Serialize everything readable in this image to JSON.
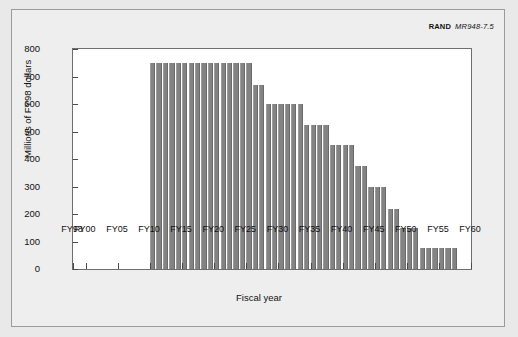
{
  "credit": {
    "org": "RAND",
    "number": "MR948-7.5"
  },
  "chart_data": {
    "type": "bar",
    "title": "",
    "xlabel": "Fiscal year",
    "ylabel": "Millions of FY98 dollars",
    "ylim": [
      0,
      800
    ],
    "ytick_values": [
      0,
      100,
      200,
      300,
      400,
      500,
      600,
      700,
      800
    ],
    "ytick_labels": [
      "0",
      "100",
      "200",
      "300",
      "400",
      "500",
      "600",
      "700",
      "800"
    ],
    "xlim": [
      1998,
      1960
    ],
    "xtick_labels": [
      "FY98",
      "FY00",
      "FY05",
      "FY10",
      "FY15",
      "FY20",
      "FY25",
      "FY30",
      "FY35",
      "FY40",
      "FY45",
      "FY50",
      "FY55",
      "FY60"
    ],
    "xtick_positions": [
      1998,
      2000,
      2005,
      2010,
      2015,
      2020,
      2025,
      2030,
      2035,
      2040,
      2045,
      2050,
      2055,
      2060
    ],
    "grid": false,
    "legend": "none",
    "bar_color": "#838383",
    "categories": [
      "FY10",
      "FY11",
      "FY12",
      "FY13",
      "FY14",
      "FY15",
      "FY16",
      "FY17",
      "FY18",
      "FY19",
      "FY20",
      "FY21",
      "FY22",
      "FY23",
      "FY24",
      "FY25",
      "FY26",
      "FY27",
      "FY28",
      "FY29",
      "FY30",
      "FY31",
      "FY32",
      "FY33",
      "FY34",
      "FY35",
      "FY36",
      "FY37",
      "FY38",
      "FY39",
      "FY40",
      "FY41",
      "FY42",
      "FY43",
      "FY44",
      "FY45",
      "FY46",
      "FY47",
      "FY48",
      "FY49",
      "FY50",
      "FY51",
      "FY52",
      "FY53",
      "FY54",
      "FY55",
      "FY56",
      "FY57"
    ],
    "values": [
      750,
      750,
      750,
      750,
      750,
      750,
      750,
      750,
      750,
      750,
      750,
      750,
      750,
      750,
      750,
      750,
      670,
      670,
      600,
      600,
      600,
      600,
      600,
      600,
      525,
      525,
      525,
      525,
      450,
      450,
      450,
      450,
      375,
      375,
      300,
      300,
      300,
      220,
      220,
      150,
      150,
      150,
      75,
      75,
      75,
      75,
      75,
      75
    ]
  }
}
